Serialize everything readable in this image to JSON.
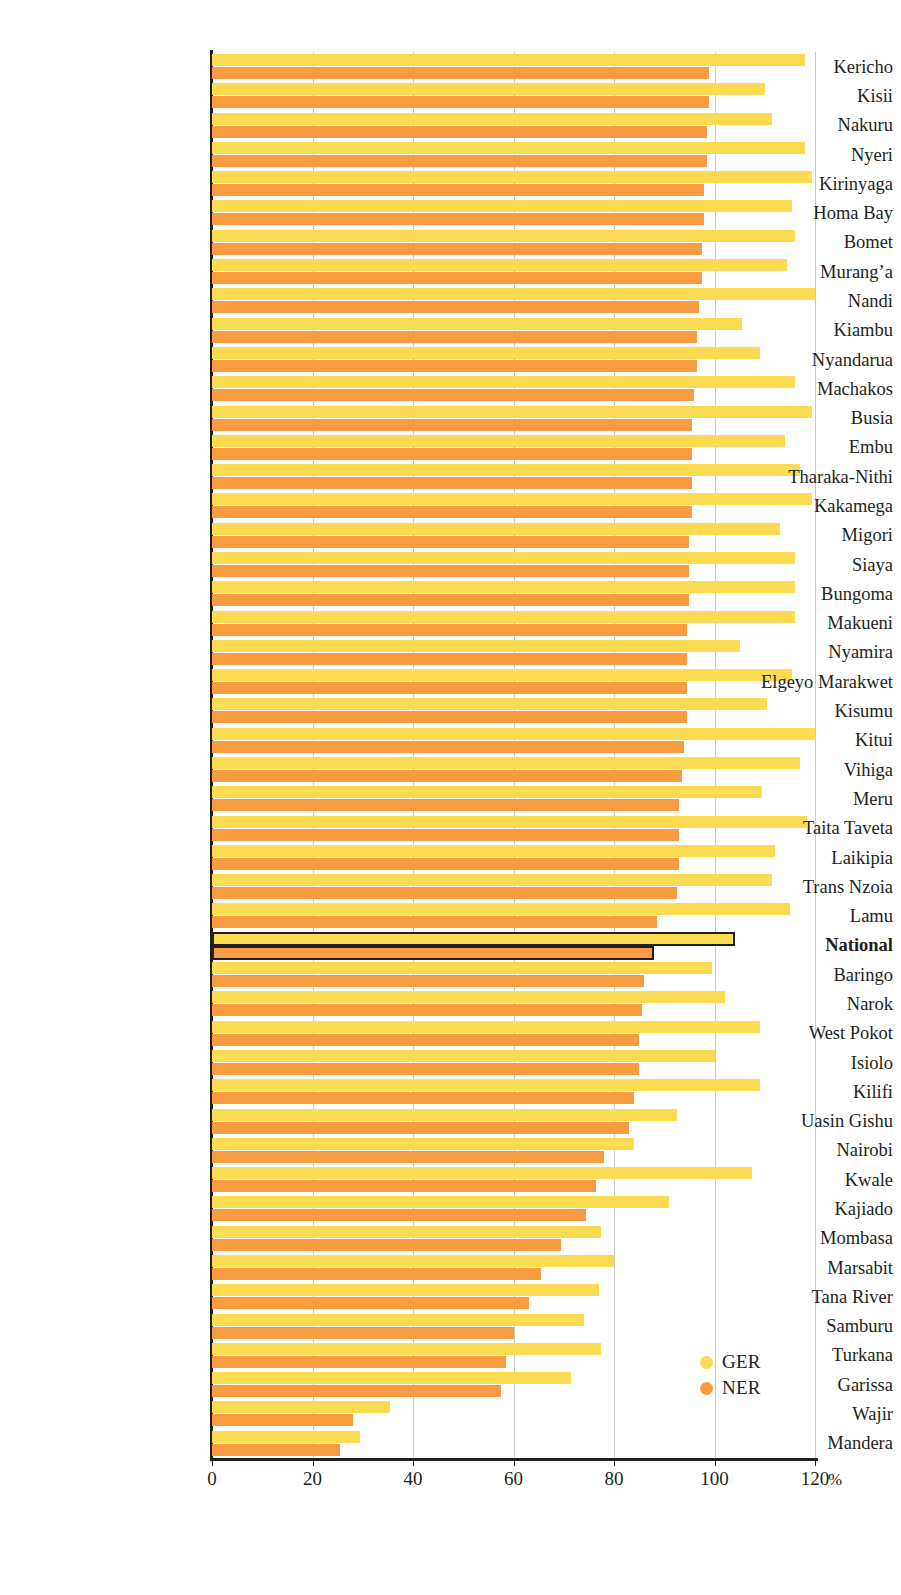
{
  "axis": {
    "x_unit": "%",
    "x_ticks": [
      0,
      20,
      40,
      60,
      80,
      100,
      120
    ],
    "x_tick_labels": [
      "0",
      "20",
      "40",
      "60",
      "80",
      "100",
      "120"
    ]
  },
  "legend": {
    "items": [
      {
        "label": "GER",
        "color": "#fadb52"
      },
      {
        "label": "NER",
        "color": "#f89b41"
      }
    ]
  },
  "colors": {
    "ger": "#fadb52",
    "ner": "#f89b41",
    "axis": "#231f20",
    "grid": "#c9c9c9",
    "highlight_outline": "#231f20"
  },
  "chart_data": {
    "type": "bar",
    "orientation": "horizontal",
    "title": "",
    "xlabel": "%",
    "ylabel": "",
    "xlim": [
      0,
      120
    ],
    "grid": true,
    "legend_position": "bottom-right",
    "categories": [
      "Kericho",
      "Kisii",
      "Nakuru",
      "Nyeri",
      "Kirinyaga",
      "Homa Bay",
      "Bomet",
      "Murang’a",
      "Nandi",
      "Kiambu",
      "Nyandarua",
      "Machakos",
      "Busia",
      "Embu",
      "Tharaka-Nithi",
      "Kakamega",
      "Migori",
      "Siaya",
      "Bungoma",
      "Makueni",
      "Nyamira",
      "Elgeyo Marakwet",
      "Kisumu",
      "Kitui",
      "Vihiga",
      "Meru",
      "Taita Taveta",
      "Laikipia",
      "Trans Nzoia",
      "Lamu",
      "National",
      "Baringo",
      "Narok",
      "West Pokot",
      "Isiolo",
      "Kilifi",
      "Uasin Gishu",
      "Nairobi",
      "Kwale",
      "Kajiado",
      "Mombasa",
      "Marsabit",
      "Tana River",
      "Samburu",
      "Turkana",
      "Garissa",
      "Wajir",
      "Mandera"
    ],
    "highlight_category": "National",
    "series": [
      {
        "name": "GER",
        "color": "#fadb52",
        "values": [
          118.0,
          110.0,
          111.5,
          118.0,
          119.5,
          115.5,
          116.0,
          114.5,
          120.0,
          105.5,
          109.0,
          116.0,
          119.5,
          114.0,
          117.0,
          119.5,
          113.0,
          116.0,
          116.0,
          116.0,
          105.0,
          115.5,
          110.5,
          120.0,
          117.0,
          109.5,
          118.5,
          112.0,
          111.5,
          115.0,
          104.0,
          99.5,
          102.0,
          109.0,
          100.0,
          109.0,
          92.5,
          84.0,
          107.5,
          91.0,
          77.5,
          80.0,
          77.0,
          74.0,
          77.5,
          71.5,
          35.5,
          29.5
        ]
      },
      {
        "name": "NER",
        "color": "#f89b41",
        "values": [
          99.0,
          99.0,
          98.5,
          98.5,
          98.0,
          98.0,
          97.5,
          97.5,
          97.0,
          96.5,
          96.5,
          96.0,
          95.5,
          95.5,
          95.5,
          95.5,
          95.0,
          95.0,
          95.0,
          94.5,
          94.5,
          94.5,
          94.5,
          94.0,
          93.5,
          93.0,
          93.0,
          93.0,
          92.5,
          88.5,
          88.0,
          86.0,
          85.5,
          85.0,
          85.0,
          84.0,
          83.0,
          78.0,
          76.5,
          74.5,
          69.5,
          65.5,
          63.0,
          60.0,
          58.5,
          57.5,
          28.0,
          25.5
        ]
      }
    ]
  }
}
